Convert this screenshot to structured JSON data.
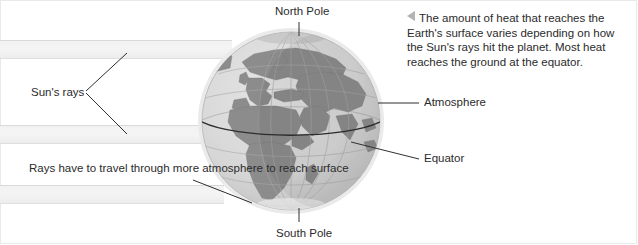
{
  "diagram": {
    "caption": {
      "arrow_icon": "triangle-left-icon",
      "text": "The amount of heat that reaches the Earth's surface varies depending on how the Sun's rays hit the planet. Most heat reaches the ground at the equator."
    },
    "labels": {
      "north_pole": "North Pole",
      "south_pole": "South Pole",
      "suns_rays": "Sun's rays",
      "atmosphere": "Atmosphere",
      "equator": "Equator",
      "rays_travel": "Rays have to travel through more atmosphere to reach surface"
    },
    "colors": {
      "land": "#8c8c8c",
      "ocean": "#d9d9d9",
      "atmosphere_ring": "#efefef",
      "ray_band": "#f2f2f2",
      "ray_band_edge": "#d9d9d9",
      "line": "#3a3a3a",
      "text": "#2b2b2b",
      "background": "#ffffff",
      "frame": "#e9e9e9"
    },
    "globe": {
      "center_x": 291,
      "center_y": 121,
      "radius": 92,
      "features": [
        "Africa",
        "Europe",
        "Arabian Peninsula",
        "Madagascar",
        "Great Britain",
        "Mediterranean Sea"
      ]
    },
    "ray_bands": [
      {
        "name": "upper-ray-band",
        "top": 40,
        "height": 19
      },
      {
        "name": "middle-ray-band",
        "top": 125,
        "height": 19
      },
      {
        "name": "lower-ray-band",
        "top": 185,
        "height": 19
      }
    ]
  }
}
